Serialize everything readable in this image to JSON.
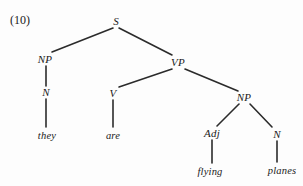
{
  "figure": {
    "example_number": "(10)",
    "sentence": "they are flying planes",
    "background_color": "#fdfdfd",
    "line_color": "#2b2b2b",
    "text_color": "#1a1a1a"
  },
  "nodes": [
    {
      "id": "S",
      "label": "S",
      "kind": "nonterminal",
      "x": 116,
      "y": 21
    },
    {
      "id": "NP1",
      "label": "NP",
      "kind": "nonterminal",
      "x": 45,
      "y": 59
    },
    {
      "id": "VP",
      "label": "VP",
      "kind": "nonterminal",
      "x": 178,
      "y": 62
    },
    {
      "id": "N1",
      "label": "N",
      "kind": "nonterminal",
      "x": 46,
      "y": 92
    },
    {
      "id": "V",
      "label": "V",
      "kind": "nonterminal",
      "x": 113,
      "y": 93
    },
    {
      "id": "NP2",
      "label": "NP",
      "kind": "nonterminal",
      "x": 244,
      "y": 97
    },
    {
      "id": "Adj",
      "label": "Adj",
      "kind": "nonterminal",
      "x": 212,
      "y": 133
    },
    {
      "id": "N2",
      "label": "N",
      "kind": "nonterminal",
      "x": 277,
      "y": 134
    },
    {
      "id": "they",
      "label": "they",
      "kind": "terminal",
      "x": 47,
      "y": 135
    },
    {
      "id": "are",
      "label": "are",
      "kind": "terminal",
      "x": 113,
      "y": 135
    },
    {
      "id": "flying",
      "label": "flying",
      "kind": "terminal",
      "x": 210,
      "y": 171
    },
    {
      "id": "planes",
      "label": "planes",
      "kind": "terminal",
      "x": 282,
      "y": 170
    }
  ],
  "edges": [
    {
      "from": "S",
      "to": "NP1",
      "x1": 113,
      "y1": 28,
      "x2": 52,
      "y2": 52
    },
    {
      "from": "S",
      "to": "VP",
      "x1": 119,
      "y1": 28,
      "x2": 172,
      "y2": 55
    },
    {
      "from": "NP1",
      "to": "N1",
      "x1": 46,
      "y1": 66,
      "x2": 46,
      "y2": 86
    },
    {
      "from": "N1",
      "to": "they",
      "x1": 46,
      "y1": 99,
      "x2": 46,
      "y2": 127
    },
    {
      "from": "VP",
      "to": "V",
      "x1": 172,
      "y1": 69,
      "x2": 119,
      "y2": 87
    },
    {
      "from": "VP",
      "to": "NP2",
      "x1": 185,
      "y1": 69,
      "x2": 238,
      "y2": 91
    },
    {
      "from": "V",
      "to": "are",
      "x1": 113,
      "y1": 100,
      "x2": 113,
      "y2": 127
    },
    {
      "from": "NP2",
      "to": "Adj",
      "x1": 239,
      "y1": 104,
      "x2": 217,
      "y2": 126
    },
    {
      "from": "NP2",
      "to": "N2",
      "x1": 250,
      "y1": 104,
      "x2": 272,
      "y2": 127
    },
    {
      "from": "Adj",
      "to": "flying",
      "x1": 212,
      "y1": 140,
      "x2": 212,
      "y2": 163
    },
    {
      "from": "N2",
      "to": "planes",
      "x1": 277,
      "y1": 141,
      "x2": 277,
      "y2": 162
    }
  ],
  "example_label": {
    "text": "(10)",
    "x": 20,
    "y": 20
  }
}
